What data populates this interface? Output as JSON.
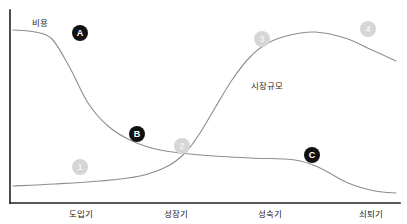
{
  "chart_data": {
    "type": "line",
    "title": "",
    "xlabel": "",
    "ylabel": "",
    "grid": false,
    "legend_position": "inline-labels",
    "categories": [
      "도입기",
      "성장기",
      "성숙기",
      "쇠퇴기"
    ],
    "series": [
      {
        "name": "비용",
        "label": "비용",
        "color": "#8e8e8e",
        "description": "Cost curve: starts high, declines steeply through growth stage, flattens low through maturity, falls again in decline stage.",
        "points": [
          {
            "x": 13,
            "y": 30
          },
          {
            "x": 35,
            "y": 32
          },
          {
            "x": 52,
            "y": 39
          },
          {
            "x": 70,
            "y": 68
          },
          {
            "x": 88,
            "y": 103
          },
          {
            "x": 108,
            "y": 126
          },
          {
            "x": 132,
            "y": 141
          },
          {
            "x": 160,
            "y": 150
          },
          {
            "x": 200,
            "y": 155
          },
          {
            "x": 250,
            "y": 158
          },
          {
            "x": 295,
            "y": 160
          },
          {
            "x": 320,
            "y": 168
          },
          {
            "x": 348,
            "y": 183
          },
          {
            "x": 375,
            "y": 191
          },
          {
            "x": 396,
            "y": 193
          }
        ]
      },
      {
        "name": "시장규모",
        "label": "시장규모",
        "color": "#8e8e8e",
        "description": "Market size curve: near zero at introduction, rises slowly, accelerates sharply through growth, peaks in maturity, then declines.",
        "points": [
          {
            "x": 13,
            "y": 186
          },
          {
            "x": 55,
            "y": 184
          },
          {
            "x": 100,
            "y": 181
          },
          {
            "x": 140,
            "y": 176
          },
          {
            "x": 168,
            "y": 166
          },
          {
            "x": 186,
            "y": 152
          },
          {
            "x": 200,
            "y": 133
          },
          {
            "x": 215,
            "y": 108
          },
          {
            "x": 232,
            "y": 80
          },
          {
            "x": 250,
            "y": 57
          },
          {
            "x": 268,
            "y": 43
          },
          {
            "x": 290,
            "y": 35
          },
          {
            "x": 315,
            "y": 32
          },
          {
            "x": 345,
            "y": 38
          },
          {
            "x": 372,
            "y": 50
          },
          {
            "x": 396,
            "y": 61
          }
        ]
      }
    ],
    "axis": {
      "y_axis": {
        "x": 10,
        "y_top": 10,
        "y_bottom": 203
      },
      "x_axis": {
        "y": 203,
        "x_left": 10,
        "x_right": 400
      }
    }
  },
  "series_labels": [
    {
      "name": "cost-series-label",
      "text": "비용",
      "x": 32,
      "y": 19
    },
    {
      "name": "market-size-series-label",
      "text": "시장규모",
      "x": 251,
      "y": 82
    }
  ],
  "tick_labels": [
    {
      "name": "x-tick-label-introduction",
      "text": "도입기",
      "center_x": 81,
      "y": 210
    },
    {
      "name": "x-tick-label-growth",
      "text": "성장기",
      "center_x": 176,
      "y": 210
    },
    {
      "name": "x-tick-label-maturity",
      "text": "성숙기",
      "center_x": 270,
      "y": 210
    },
    {
      "name": "x-tick-label-decline",
      "text": "쇠퇴기",
      "center_x": 371,
      "y": 210
    }
  ],
  "badges": {
    "dark_color": "#111111",
    "light_color": "#d6d6d6",
    "items": [
      {
        "name": "badge-a",
        "text": "A",
        "style": "dark",
        "x": 80,
        "y": 33
      },
      {
        "name": "badge-b",
        "text": "B",
        "style": "dark",
        "x": 137,
        "y": 134
      },
      {
        "name": "badge-c",
        "text": "C",
        "style": "dark",
        "x": 312,
        "y": 155
      },
      {
        "name": "badge-1",
        "text": "1",
        "style": "light",
        "x": 80,
        "y": 167
      },
      {
        "name": "badge-2",
        "text": "2",
        "style": "light",
        "x": 182,
        "y": 146
      },
      {
        "name": "badge-3",
        "text": "3",
        "style": "light",
        "x": 262,
        "y": 39
      },
      {
        "name": "badge-4",
        "text": "4",
        "style": "light",
        "x": 368,
        "y": 29
      }
    ]
  }
}
